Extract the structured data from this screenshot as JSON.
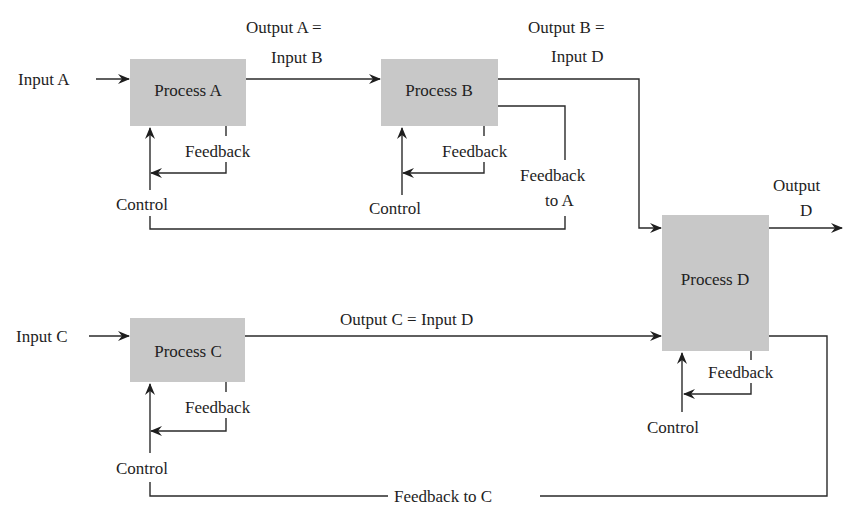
{
  "diagram": {
    "type": "process-feedback-flow",
    "colors": {
      "box_fill": "#c8c8c8",
      "line": "#2a2a2a",
      "text": "#1e1e1e",
      "background": "#ffffff"
    },
    "processes": [
      {
        "id": "A",
        "label": "Process A",
        "feedback_label": "Feedback",
        "control_label": "Control"
      },
      {
        "id": "B",
        "label": "Process B",
        "feedback_label": "Feedback",
        "control_label": "Control"
      },
      {
        "id": "C",
        "label": "Process C",
        "feedback_label": "Feedback",
        "control_label": "Control"
      },
      {
        "id": "D",
        "label": "Process D",
        "feedback_label": "Feedback",
        "control_label": "Control"
      }
    ],
    "inputs": {
      "a": "Input A",
      "c": "Input C"
    },
    "edges": {
      "a_to_b": {
        "line1": "Output A  =",
        "line2": "Input B"
      },
      "b_to_d": {
        "line1": "Output B  =",
        "line2": "Input D"
      },
      "c_to_d": {
        "label": "Output C  =  Input D"
      },
      "d_out": {
        "line1": "Output",
        "line2": "D"
      },
      "feedback_to_a": {
        "line1": "Feedback",
        "line2": "to A"
      },
      "feedback_to_c": {
        "label": "Feedback to C"
      }
    }
  }
}
